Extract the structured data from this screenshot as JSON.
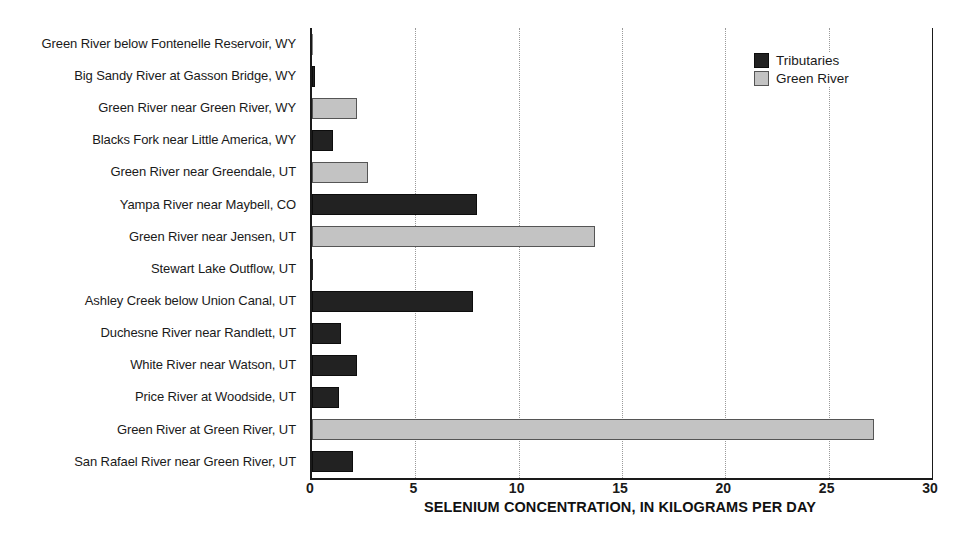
{
  "chart_data": {
    "type": "bar",
    "orientation": "horizontal",
    "title": "",
    "xlabel": "SELENIUM CONCENTRATION, IN KILOGRAMS PER DAY",
    "ylabel": "",
    "xlim": [
      0,
      30
    ],
    "xticks": [
      0,
      5,
      10,
      15,
      20,
      25,
      30
    ],
    "xtick_labels": [
      "0",
      "5",
      "10",
      "15",
      "20",
      "25",
      "30"
    ],
    "grid": "vertical-dotted",
    "legend_position": "top-right",
    "categories": [
      "Green River below Fontenelle Reservoir, WY",
      "Big Sandy River at Gasson Bridge, WY",
      "Green River near Green River, WY",
      "Blacks Fork near Little America, WY",
      "Green River near Greendale, UT",
      "Yampa River near Maybell, CO",
      "Green River near Jensen, UT",
      "Stewart Lake Outflow, UT",
      "Ashley Creek below Union Canal, UT",
      "Duchesne River near Randlett, UT",
      "White River near Watson, UT",
      "Price River at Woodside, UT",
      "Green River at Green River, UT",
      "San Rafael River near Green River, UT"
    ],
    "values": [
      0.05,
      0.15,
      2.2,
      1.0,
      2.7,
      8.0,
      13.7,
      0.05,
      7.8,
      1.4,
      2.2,
      1.3,
      27.2,
      2.0
    ],
    "groups": [
      "Green River",
      "Tributaries",
      "Green River",
      "Tributaries",
      "Green River",
      "Tributaries",
      "Green River",
      "Tributaries",
      "Tributaries",
      "Tributaries",
      "Tributaries",
      "Tributaries",
      "Green River",
      "Tributaries"
    ],
    "series": [
      {
        "name": "Tributaries",
        "color": "#222222",
        "points": [
          {
            "category": "Big Sandy River at Gasson Bridge, WY",
            "value": 0.15
          },
          {
            "category": "Blacks Fork near Little America, WY",
            "value": 1.0
          },
          {
            "category": "Yampa River near Maybell, CO",
            "value": 8.0
          },
          {
            "category": "Stewart Lake Outflow, UT",
            "value": 0.05
          },
          {
            "category": "Ashley Creek below Union Canal, UT",
            "value": 7.8
          },
          {
            "category": "Duchesne River near Randlett, UT",
            "value": 1.4
          },
          {
            "category": "White River near Watson, UT",
            "value": 2.2
          },
          {
            "category": "Price River at Woodside, UT",
            "value": 1.3
          },
          {
            "category": "San Rafael River near Green River, UT",
            "value": 2.0
          }
        ]
      },
      {
        "name": "Green River",
        "color": "#c3c3c3",
        "points": [
          {
            "category": "Green River below Fontenelle Reservoir, WY",
            "value": 0.05
          },
          {
            "category": "Green River near Green River, WY",
            "value": 2.2
          },
          {
            "category": "Green River near Greendale, UT",
            "value": 2.7
          },
          {
            "category": "Green River near Jensen, UT",
            "value": 13.7
          },
          {
            "category": "Green River at Green River, UT",
            "value": 27.2
          }
        ]
      }
    ],
    "legend": [
      {
        "label": "Tributaries",
        "color": "#222222"
      },
      {
        "label": "Green River",
        "color": "#c3c3c3"
      }
    ]
  }
}
